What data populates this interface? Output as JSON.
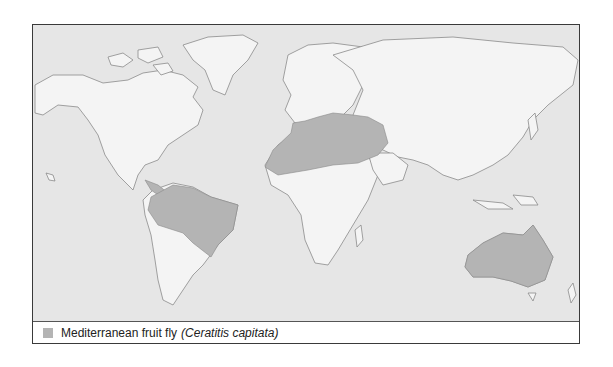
{
  "map": {
    "type": "distribution-map",
    "colors": {
      "ocean": "#e6e6e6",
      "land": "#f4f4f4",
      "coast": "#8a8a8a",
      "range": "#b4b4b4"
    },
    "shaded_regions": [
      "Central America",
      "South America (north and central)",
      "Mediterranean Europe",
      "North Africa / Sahara",
      "Middle East",
      "Australia"
    ]
  },
  "legend": {
    "items": [
      {
        "label": "Mediterranean fruit fly",
        "species": "(Ceratitis capitata)",
        "color": "#b4b4b4"
      }
    ]
  }
}
